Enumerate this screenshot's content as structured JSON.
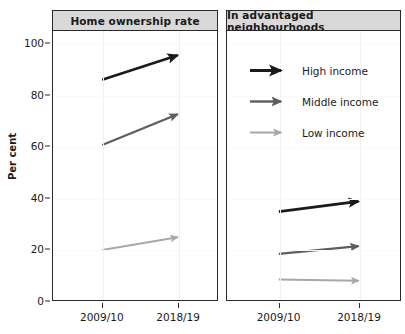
{
  "chart_data": {
    "type": "line",
    "title": "",
    "subtitle": "",
    "ylabel": "Per cent",
    "xlabel": "",
    "ylim": [
      0,
      105
    ],
    "yticks": [
      0,
      20,
      40,
      60,
      80,
      100
    ],
    "x": [
      "2009/10",
      "2018/19"
    ],
    "grid": true,
    "legend_position": "inside-right-panel-top",
    "panels": [
      {
        "label": "Home ownership rate",
        "series": [
          {
            "name": "High income",
            "values": [
              86.0,
              95.5
            ],
            "color": "#1a1a1a"
          },
          {
            "name": "Middle income",
            "values": [
              60.5,
              72.5
            ],
            "color": "#5e5e5e"
          },
          {
            "name": "Low income",
            "values": [
              19.5,
              24.5
            ],
            "color": "#a8a8a8"
          }
        ]
      },
      {
        "label": "In advantaged neighbourhoods",
        "series": [
          {
            "name": "High income",
            "values": [
              34.5,
              38.5
            ],
            "color": "#1a1a1a"
          },
          {
            "name": "Middle income",
            "values": [
              18.0,
              21.0
            ],
            "color": "#5e5e5e"
          },
          {
            "name": "Low income",
            "values": [
              8.0,
              7.5
            ],
            "color": "#a8a8a8"
          }
        ]
      }
    ],
    "legend": [
      {
        "name": "High income",
        "color": "#1a1a1a",
        "width": 3.0
      },
      {
        "name": "Middle income",
        "color": "#5e5e5e",
        "width": 2.4
      },
      {
        "name": "Low income",
        "color": "#a8a8a8",
        "width": 2.0
      }
    ]
  }
}
